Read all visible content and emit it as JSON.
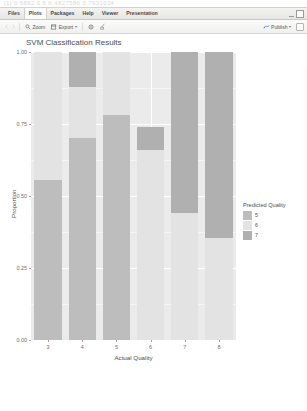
{
  "window": {
    "ghost_text": "[1] 0.5862   0.6 0.4827586 0.7931034",
    "minimize_icon": "minimize-icon",
    "maximize_icon": "maximize-icon"
  },
  "tabs": [
    {
      "label": "Files",
      "active": false
    },
    {
      "label": "Plots",
      "active": true
    },
    {
      "label": "Packages",
      "active": false
    },
    {
      "label": "Help",
      "active": false
    },
    {
      "label": "Viewer",
      "active": false
    },
    {
      "label": "Presentation",
      "active": false
    }
  ],
  "toolbar": {
    "back_icon": "back-arrow-icon",
    "forward_icon": "forward-arrow-icon",
    "zoom_label": "Zoom",
    "zoom_icon": "magnifier-icon",
    "export_label": "Export",
    "export_icon": "export-icon",
    "export_caret": "▾",
    "remove_icon": "remove-plot-icon",
    "clear_icon": "broom-clear-icon",
    "publish_label": "Publish",
    "publish_icon": "publish-icon",
    "publish_caret": "▾",
    "settings_icon": "panel-options-icon"
  },
  "chart_data": {
    "type": "bar",
    "stacked": true,
    "stack_normalized": true,
    "title": "SVM Classification Results",
    "xlabel": "Actual Quality",
    "ylabel": "Proportion",
    "categories": [
      "3",
      "4",
      "5",
      "6",
      "7",
      "8"
    ],
    "xticklabels": [
      "3",
      "4",
      "5",
      "6",
      "7",
      "8"
    ],
    "yticklabels": [
      "0.00",
      "0.25",
      "0.50",
      "0.75",
      "1.00"
    ],
    "ytickvalues": [
      0.0,
      0.25,
      0.5,
      0.75,
      1.0
    ],
    "ylim": [
      0,
      1
    ],
    "grid": true,
    "legend_title": "Predicted Quality",
    "legend_position": "right",
    "series": [
      {
        "name": "5",
        "color": "#bdbdbd",
        "values": [
          0.555,
          0.7,
          0.78,
          0.0,
          0.0,
          0.0
        ]
      },
      {
        "name": "6",
        "color": "#e3e3e3",
        "values": [
          0.445,
          0.18,
          0.22,
          0.66,
          0.44,
          0.355
        ]
      },
      {
        "name": "7",
        "color": "#b0b0b0",
        "values": [
          0.0,
          0.12,
          0.0,
          0.08,
          0.56,
          0.645
        ]
      }
    ],
    "panel_background": "#ebebeb",
    "grid_color": "#ffffff"
  }
}
